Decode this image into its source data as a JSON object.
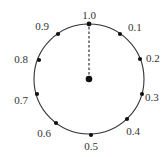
{
  "diagram": {
    "type": "circular-dial",
    "center": {
      "x": 89,
      "y": 79
    },
    "radius": 55,
    "stroke_color": "#333333",
    "dot_color": "#111111",
    "marks": [
      {
        "label": "1.0",
        "dot": [
          89,
          24
        ],
        "text": [
          89,
          19
        ],
        "anchor": "middle"
      },
      {
        "label": "0.1",
        "dot": [
          120,
          34
        ],
        "text": [
          128,
          31
        ],
        "anchor": "start"
      },
      {
        "label": "0.2",
        "dot": [
          140,
          59
        ],
        "text": [
          146,
          62
        ],
        "anchor": "start"
      },
      {
        "label": "0.3",
        "dot": [
          142,
          94
        ],
        "text": [
          145,
          101
        ],
        "anchor": "start"
      },
      {
        "label": "0.4",
        "dot": [
          127,
          119
        ],
        "text": [
          133,
          135
        ],
        "anchor": "middle"
      },
      {
        "label": "0.5",
        "dot": [
          91,
          135
        ],
        "text": [
          91,
          150
        ],
        "anchor": "middle"
      },
      {
        "label": "0.6",
        "dot": [
          56,
          123
        ],
        "text": [
          44,
          137
        ],
        "anchor": "middle"
      },
      {
        "label": "0.7",
        "dot": [
          37,
          94
        ],
        "text": [
          28,
          104
        ],
        "anchor": "end"
      },
      {
        "label": "0.8",
        "dot": [
          39,
          60
        ],
        "text": [
          28,
          63
        ],
        "anchor": "end"
      },
      {
        "label": "0.9",
        "dot": [
          58,
          34
        ],
        "text": [
          49,
          30
        ],
        "anchor": "end"
      }
    ],
    "pointer": {
      "from": [
        89,
        79
      ],
      "to": [
        89,
        26
      ],
      "style": "dashed"
    }
  }
}
